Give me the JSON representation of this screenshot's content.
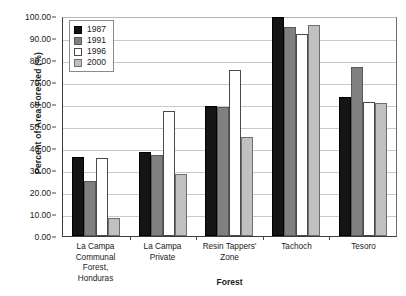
{
  "chart_data": {
    "type": "bar",
    "title": "",
    "xlabel": "Forest",
    "ylabel": "Percent of Area Forested (%)",
    "ylim": [
      0,
      100
    ],
    "ytick_step": 10,
    "ytick_labels": [
      "100.00",
      "90.00",
      "80.00",
      "70.00",
      "60.00",
      "50.00",
      "40.00",
      "30.00",
      "20.00",
      "10.00",
      "0.00"
    ],
    "grid": true,
    "legend_position": "top-left-inside",
    "categories": [
      "La Campa Communal Forest, Honduras",
      "La Campa Private",
      "Resin Tappers' Zone",
      "Tachoch",
      "Tesoro"
    ],
    "category_lines": [
      [
        "La Campa",
        "Communal Forest,",
        "Honduras"
      ],
      [
        "La Campa",
        "Private"
      ],
      [
        "Resin Tappers'",
        "Zone"
      ],
      [
        "Tachoch"
      ],
      [
        "Tesoro"
      ]
    ],
    "series": [
      {
        "name": "1987",
        "color": "#151515",
        "values": [
          36.0,
          38.0,
          59.0,
          99.5,
          63.0
        ]
      },
      {
        "name": "1991",
        "color": "#808080",
        "values": [
          25.0,
          37.0,
          58.5,
          95.0,
          77.0
        ]
      },
      {
        "name": "1996",
        "color": "#ffffff",
        "values": [
          35.5,
          57.0,
          75.5,
          92.0,
          61.0
        ]
      },
      {
        "name": "2000",
        "color": "#c0c0c0",
        "values": [
          8.0,
          28.0,
          45.0,
          96.0,
          60.5
        ]
      }
    ]
  }
}
